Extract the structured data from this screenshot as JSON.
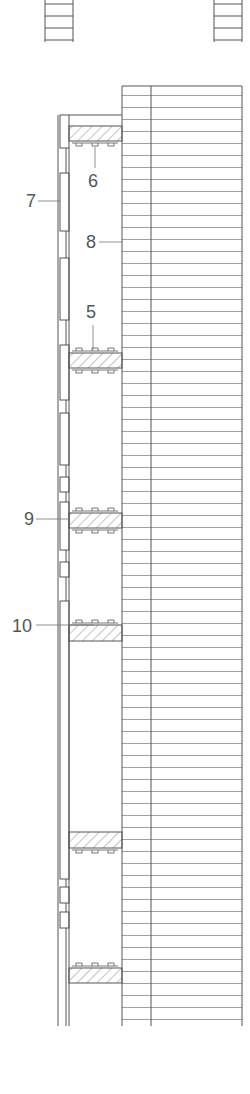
{
  "diagram": {
    "type": "architectural section drawing",
    "labels": [
      {
        "id": "6",
        "text": "6",
        "x": 88,
        "y": 172
      },
      {
        "id": "7",
        "text": "7",
        "x": 26,
        "y": 192
      },
      {
        "id": "8",
        "text": "8",
        "x": 86,
        "y": 233
      },
      {
        "id": "5",
        "text": "5",
        "x": 86,
        "y": 303
      },
      {
        "id": "9",
        "text": "9",
        "x": 24,
        "y": 510
      },
      {
        "id": "10",
        "text": "10",
        "x": 12,
        "y": 617
      }
    ],
    "colors": {
      "line": "#555555",
      "hatch": "#777777",
      "text": "#555555"
    }
  }
}
